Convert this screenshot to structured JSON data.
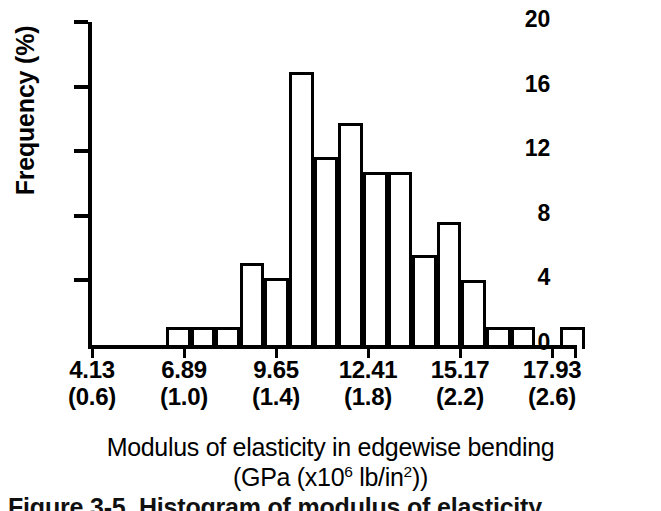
{
  "figure": {
    "caption": "Figure 3-5. Histogram of modulus of elasticity"
  },
  "chart_data": {
    "type": "bar",
    "title": "",
    "xlabel": "Modulus of elasticity in edgewise bending",
    "xlabel_units_prefix": "(GPa (x10",
    "xlabel_units_sup1": "6",
    "xlabel_units_mid": " lb/in",
    "xlabel_units_sup2": "2",
    "xlabel_units_suffix": "))",
    "ylabel": "Frequency (%)",
    "ylim": [
      0,
      20
    ],
    "yticks": [
      0,
      4,
      8,
      12,
      16,
      20
    ],
    "ytick_labels": [
      "0",
      "4",
      "8",
      "12",
      "16",
      "20"
    ],
    "grid": false,
    "legend": false,
    "xtick_labels_gpa": [
      "4.13",
      "6.89",
      "9.65",
      "12.41",
      "15.17",
      "17.93"
    ],
    "xtick_labels_psi": [
      "(0.6)",
      "(1.0)",
      "(1.4)",
      "(1.8)",
      "(2.2)",
      "(2.6)"
    ],
    "xtick_values": [
      4.13,
      6.89,
      9.65,
      12.41,
      15.17,
      17.93
    ],
    "bin_width_gpa": 0.69,
    "bin_edges": [
      4.13,
      4.82,
      5.51,
      6.2,
      6.89,
      7.58,
      8.27,
      8.96,
      9.65,
      10.34,
      11.03,
      11.72,
      12.41,
      13.1,
      13.79,
      14.48,
      15.17,
      15.86,
      16.55,
      17.24,
      17.93,
      18.62
    ],
    "categories": [
      "4.13-4.82",
      "4.82-5.51",
      "5.51-6.20",
      "6.20-6.89",
      "6.89-7.58",
      "7.58-8.27",
      "8.27-8.96",
      "8.96-9.65",
      "9.65-10.34",
      "10.34-11.03",
      "11.03-11.72",
      "11.72-12.41",
      "12.41-13.10",
      "13.10-13.79",
      "13.79-14.48",
      "14.48-15.17",
      "15.17-15.86",
      "15.86-16.55",
      "16.55-17.24",
      "17.24-17.93",
      "17.93-18.62"
    ],
    "values": [
      0,
      1.1,
      1.1,
      1.1,
      5.0,
      4.1,
      16.7,
      11.5,
      13.6,
      10.6,
      10.6,
      5.5,
      7.5,
      4.0,
      1.1,
      1.1,
      0,
      0,
      1.1,
      0,
      0
    ],
    "bars": [
      {
        "index": 0,
        "value": 1.1,
        "left_pct": 15.3,
        "width_pct": 5.1
      },
      {
        "index": 1,
        "value": 1.1,
        "left_pct": 20.4,
        "width_pct": 5.1
      },
      {
        "index": 2,
        "value": 1.1,
        "left_pct": 25.5,
        "width_pct": 5.1
      },
      {
        "index": 3,
        "value": 5.0,
        "left_pct": 30.6,
        "width_pct": 5.1
      },
      {
        "index": 4,
        "value": 4.1,
        "left_pct": 35.7,
        "width_pct": 5.1
      },
      {
        "index": 5,
        "value": 16.7,
        "left_pct": 40.8,
        "width_pct": 5.1
      },
      {
        "index": 6,
        "value": 11.5,
        "left_pct": 45.9,
        "width_pct": 5.1
      },
      {
        "index": 7,
        "value": 13.6,
        "left_pct": 51.0,
        "width_pct": 5.1
      },
      {
        "index": 8,
        "value": 10.6,
        "left_pct": 56.1,
        "width_pct": 5.1
      },
      {
        "index": 9,
        "value": 10.6,
        "left_pct": 61.2,
        "width_pct": 5.1
      },
      {
        "index": 10,
        "value": 5.5,
        "left_pct": 66.3,
        "width_pct": 5.1
      },
      {
        "index": 11,
        "value": 7.5,
        "left_pct": 71.4,
        "width_pct": 5.1
      },
      {
        "index": 12,
        "value": 4.0,
        "left_pct": 76.5,
        "width_pct": 5.1
      },
      {
        "index": 13,
        "value": 1.1,
        "left_pct": 81.6,
        "width_pct": 5.1
      },
      {
        "index": 14,
        "value": 1.1,
        "left_pct": 86.7,
        "width_pct": 5.1
      },
      {
        "index": 15,
        "value": 1.1,
        "left_pct": 96.9,
        "width_pct": 5.1
      }
    ],
    "colors": {
      "bar_fill": "#ffffff",
      "bar_edge": "#000000",
      "axis": "#000000",
      "text": "#000000",
      "background": "#ffffff"
    }
  }
}
